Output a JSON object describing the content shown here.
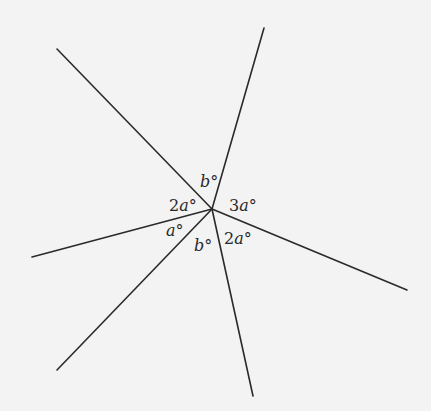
{
  "diagram": {
    "center": {
      "x": 212,
      "y": 209
    },
    "rays": [
      {
        "name": "upper-left",
        "end": {
          "x": 57,
          "y": 49
        }
      },
      {
        "name": "top",
        "end": {
          "x": 264,
          "y": 28
        }
      },
      {
        "name": "right",
        "end": {
          "x": 407,
          "y": 290
        }
      },
      {
        "name": "bottom",
        "end": {
          "x": 253,
          "y": 396
        }
      },
      {
        "name": "lower-left",
        "end": {
          "x": 57,
          "y": 370
        }
      },
      {
        "name": "left",
        "end": {
          "x": 32,
          "y": 257
        }
      }
    ],
    "angle_labels": [
      {
        "id": "top",
        "coef": "",
        "var": "b",
        "deg": "°",
        "x": 200,
        "y": 187
      },
      {
        "id": "upper-left",
        "coef": "2",
        "var": "a",
        "deg": "°",
        "x": 169,
        "y": 211
      },
      {
        "id": "right",
        "coef": "3",
        "var": "a",
        "deg": "°",
        "x": 229,
        "y": 211
      },
      {
        "id": "left-lower",
        "coef": "",
        "var": "a",
        "deg": "°",
        "x": 166,
        "y": 236
      },
      {
        "id": "bottom",
        "coef": "",
        "var": "b",
        "deg": "°",
        "x": 194,
        "y": 251
      },
      {
        "id": "lower-right",
        "coef": "2",
        "var": "a",
        "deg": "°",
        "x": 224,
        "y": 244
      }
    ]
  }
}
